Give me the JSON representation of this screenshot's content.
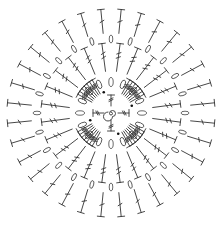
{
  "diagram": {
    "type": "crochet-chart",
    "title": "",
    "symmetry": 4,
    "colors": {
      "stroke": "#333333",
      "background": "#ffffff",
      "dot": "#111111"
    },
    "center": {
      "symbol": "magic-ring",
      "stitches": [
        "double-crochet",
        "double-crochet",
        "double-crochet",
        "double-crochet"
      ]
    },
    "rounds": [
      {
        "name": "fan-shells",
        "stitch": "treble-crochet",
        "fans": 4,
        "stitches_per_fan": 7
      },
      {
        "name": "chain-spaces-inner",
        "stitch": "chain",
        "count": 16
      },
      {
        "name": "treble-spokes",
        "stitch": "treble-crochet",
        "count": 24
      },
      {
        "name": "chain-spaces-outer",
        "stitch": "chain",
        "count": 24
      },
      {
        "name": "outer-spokes",
        "stitch": "double-crochet",
        "count": 32
      }
    ]
  }
}
